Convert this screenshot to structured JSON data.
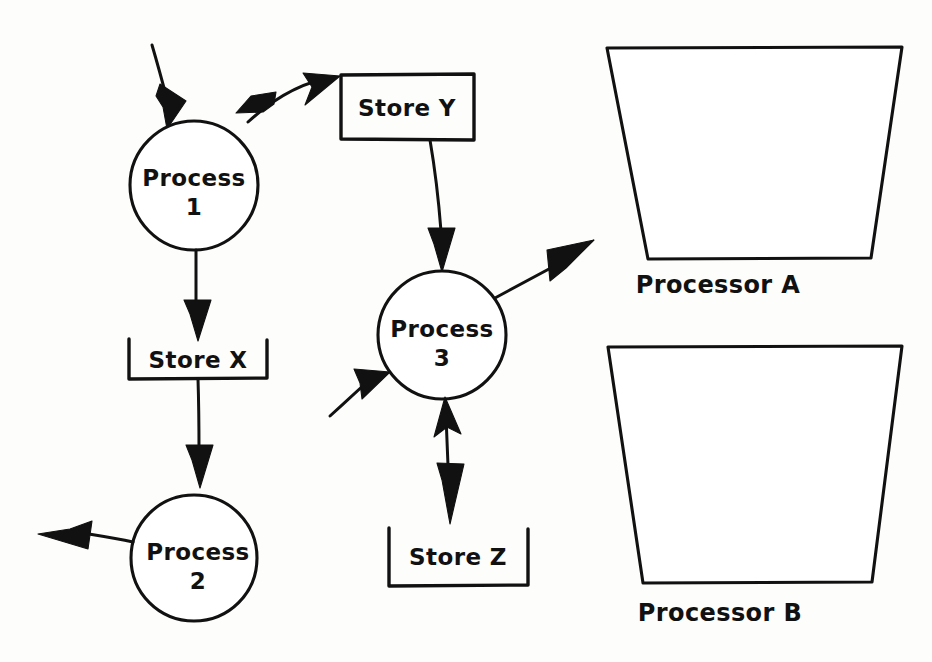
{
  "diagram": {
    "type": "data-flow-diagram",
    "background_color": "#fdfdfb",
    "ink_color": "#111111",
    "style": "hand-drawn"
  },
  "processes": [
    {
      "id": "process-1",
      "name_line1": "Process",
      "name_line2": "1",
      "shape": "circle",
      "cx": 194,
      "cy": 185,
      "r": 64
    },
    {
      "id": "process-2",
      "name_line1": "Process",
      "name_line2": "2",
      "shape": "circle",
      "cx": 194,
      "cy": 558,
      "r": 63
    },
    {
      "id": "process-3",
      "name_line1": "Process",
      "name_line2": "3",
      "shape": "circle",
      "cx": 442,
      "cy": 335,
      "r": 64
    }
  ],
  "stores": [
    {
      "id": "store-y",
      "label": "Store Y",
      "open_side": "left",
      "x": 341,
      "y": 75,
      "width": 133,
      "height": 65
    },
    {
      "id": "store-x",
      "label": "Store X",
      "open_side": "top",
      "x": 129,
      "y": 339,
      "width": 138,
      "height": 40
    },
    {
      "id": "store-z",
      "label": "Store Z",
      "open_side": "top",
      "x": 389,
      "y": 528,
      "width": 139,
      "height": 58
    }
  ],
  "processors": [
    {
      "id": "processor-a",
      "label": "Processor A",
      "shape": "inverted-trapezoid",
      "top_left_x": 607,
      "top_right_x": 902,
      "top_y": 48,
      "bottom_left_x": 648,
      "bottom_right_x": 871,
      "bottom_y": 258,
      "label_x": 718,
      "label_y": 290
    },
    {
      "id": "processor-b",
      "label": "Processor B",
      "shape": "inverted-trapezoid",
      "top_left_x": 608,
      "top_right_x": 902,
      "top_y": 347,
      "bottom_left_x": 643,
      "bottom_right_x": 872,
      "bottom_y": 582,
      "label_x": 720,
      "label_y": 618
    }
  ],
  "flows": [
    {
      "id": "flow-external-to-process-1",
      "from": "external",
      "to": "process-1",
      "direction": "one-way"
    },
    {
      "id": "flow-process-1-store-y",
      "from": "process-1",
      "to": "store-y",
      "direction": "two-way"
    },
    {
      "id": "flow-store-y-to-process-3",
      "from": "store-y",
      "to": "process-3",
      "direction": "one-way"
    },
    {
      "id": "flow-process-1-to-store-x",
      "from": "process-1",
      "to": "store-x",
      "direction": "one-way"
    },
    {
      "id": "flow-store-x-to-process-2",
      "from": "store-x",
      "to": "process-2",
      "direction": "one-way"
    },
    {
      "id": "flow-process-2-to-external",
      "from": "process-2",
      "to": "external",
      "direction": "one-way"
    },
    {
      "id": "flow-external-to-process-3",
      "from": "external",
      "to": "process-3",
      "direction": "one-way"
    },
    {
      "id": "flow-process-3-to-external",
      "from": "process-3",
      "to": "external",
      "direction": "one-way"
    },
    {
      "id": "flow-process-3-store-z",
      "from": "process-3",
      "to": "store-z",
      "direction": "two-way"
    }
  ]
}
